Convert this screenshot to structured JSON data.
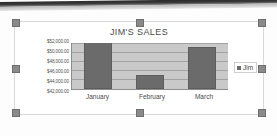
{
  "canvas": {
    "background_color": "#fdfdfd",
    "scan_artifact": "dark-bar-top"
  },
  "chart_object": {
    "selected": true,
    "handle_color": "#8a8a8a",
    "handles": [
      "top-left",
      "top-center",
      "top-right",
      "middle-left",
      "middle-right",
      "bottom-left",
      "bottom-center",
      "bottom-right"
    ]
  },
  "chart_data": {
    "type": "bar",
    "title": "JIM'S SALES",
    "xlabel": "",
    "ylabel": "",
    "categories": [
      "January",
      "February",
      "March"
    ],
    "values": [
      52000,
      45000,
      51000
    ],
    "series": [
      {
        "name": "Jim",
        "values": [
          52000,
          45000,
          51000
        ],
        "color": "#6b6b6b"
      }
    ],
    "ylim": [
      42000,
      52000
    ],
    "ytick_values": [
      52000,
      50000,
      48000,
      46000,
      44000,
      42000
    ],
    "ytick_labels": [
      "$52,000.00",
      "$50,000.00",
      "$48,000.00",
      "$46,000.00",
      "$44,000.00",
      "$42,000.00"
    ],
    "grid": true,
    "legend_position": "right",
    "legend_entries": [
      "Jim"
    ],
    "plot_background_color": "#c9c9c9",
    "gridline_color": "#a2a2a2"
  }
}
